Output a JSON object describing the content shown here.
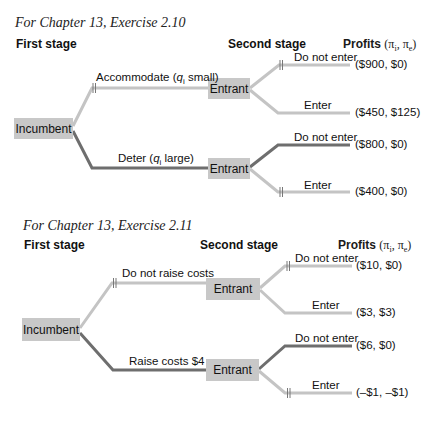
{
  "colors": {
    "light_branch": "#c4c4c4",
    "dark_branch": "#6e6e6e",
    "node_fill": "#c8c8c8",
    "hash_mark": "#777777"
  },
  "diagrams": [
    {
      "title": "For Chapter 13, Exercise 2.10",
      "headers": {
        "first_stage": "First stage",
        "second_stage": "Second stage",
        "profits": "Profits",
        "profits_vars": "(πi, πe)"
      },
      "root": {
        "label": "Incumbent"
      },
      "branches": [
        {
          "action": "Accommodate (qi small)",
          "action_parts": {
            "pre": "Accommodate (",
            "var": "q",
            "sub": "i",
            "post": " small)"
          },
          "emphasis": "light",
          "pruned": true,
          "node": "Entrant",
          "children": [
            {
              "action": "Do not enter",
              "payoff": "($900, $0)",
              "emphasis": "light",
              "pruned": true
            },
            {
              "action": "Enter",
              "payoff": "($450, $125)",
              "emphasis": "light",
              "pruned": false
            }
          ]
        },
        {
          "action": "Deter (qi large)",
          "action_parts": {
            "pre": "Deter (",
            "var": "q",
            "sub": "i",
            "post": " large)"
          },
          "emphasis": "dark",
          "pruned": false,
          "node": "Entrant",
          "children": [
            {
              "action": "Do not enter",
              "payoff": "($800, $0)",
              "emphasis": "dark",
              "pruned": false
            },
            {
              "action": "Enter",
              "payoff": "($400, $0)",
              "emphasis": "light",
              "pruned": true
            }
          ]
        }
      ]
    },
    {
      "title": "For Chapter 13, Exercise 2.11",
      "headers": {
        "first_stage": "First stage",
        "second_stage": "Second stage",
        "profits": "Profits",
        "profits_vars": "(πi, πe)"
      },
      "root": {
        "label": "Incumbent"
      },
      "branches": [
        {
          "action": "Do not raise costs",
          "emphasis": "light",
          "pruned": true,
          "node": "Entrant",
          "children": [
            {
              "action": "Do not enter",
              "payoff": "($10, $0)",
              "emphasis": "light",
              "pruned": true
            },
            {
              "action": "Enter",
              "payoff": "($3, $3)",
              "emphasis": "light",
              "pruned": false
            }
          ]
        },
        {
          "action": "Raise costs $4",
          "emphasis": "dark",
          "pruned": false,
          "node": "Entrant",
          "children": [
            {
              "action": "Do not enter",
              "payoff": "($6, $0)",
              "emphasis": "dark",
              "pruned": false
            },
            {
              "action": "Enter",
              "payoff": "(–$1, –$1)",
              "emphasis": "light",
              "pruned": true
            }
          ]
        }
      ]
    }
  ]
}
